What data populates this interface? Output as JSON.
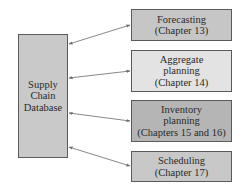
{
  "diagram": {
    "central_node": {
      "lines": [
        "Supply",
        "Chain",
        "Database"
      ],
      "fill": "#c9c9c9"
    },
    "nodes": [
      {
        "lines": [
          "Forecasting",
          "(Chapter 13)"
        ],
        "fill": "#c6c6c6"
      },
      {
        "lines": [
          "Aggregate",
          "planning",
          "(Chapter 14)"
        ],
        "fill": "#e3e3e3"
      },
      {
        "lines": [
          "Inventory",
          "planning",
          "(Chapters 15 and 16)"
        ],
        "fill": "#b5b5b5"
      },
      {
        "lines": [
          "Scheduling",
          "(Chapter 17)"
        ],
        "fill": "#c8c8c8"
      }
    ],
    "edges": [
      {
        "from": "Supply Chain Database",
        "to": "Forecasting",
        "direction": "bidirectional"
      },
      {
        "from": "Supply Chain Database",
        "to": "Aggregate planning",
        "direction": "bidirectional"
      },
      {
        "from": "Supply Chain Database",
        "to": "Inventory planning",
        "direction": "bidirectional"
      },
      {
        "from": "Supply Chain Database",
        "to": "Scheduling",
        "direction": "bidirectional"
      }
    ],
    "colors": {
      "border": "#5a5a5a",
      "arrow": "#6a6a6a",
      "text": "#2a2a2a"
    }
  }
}
